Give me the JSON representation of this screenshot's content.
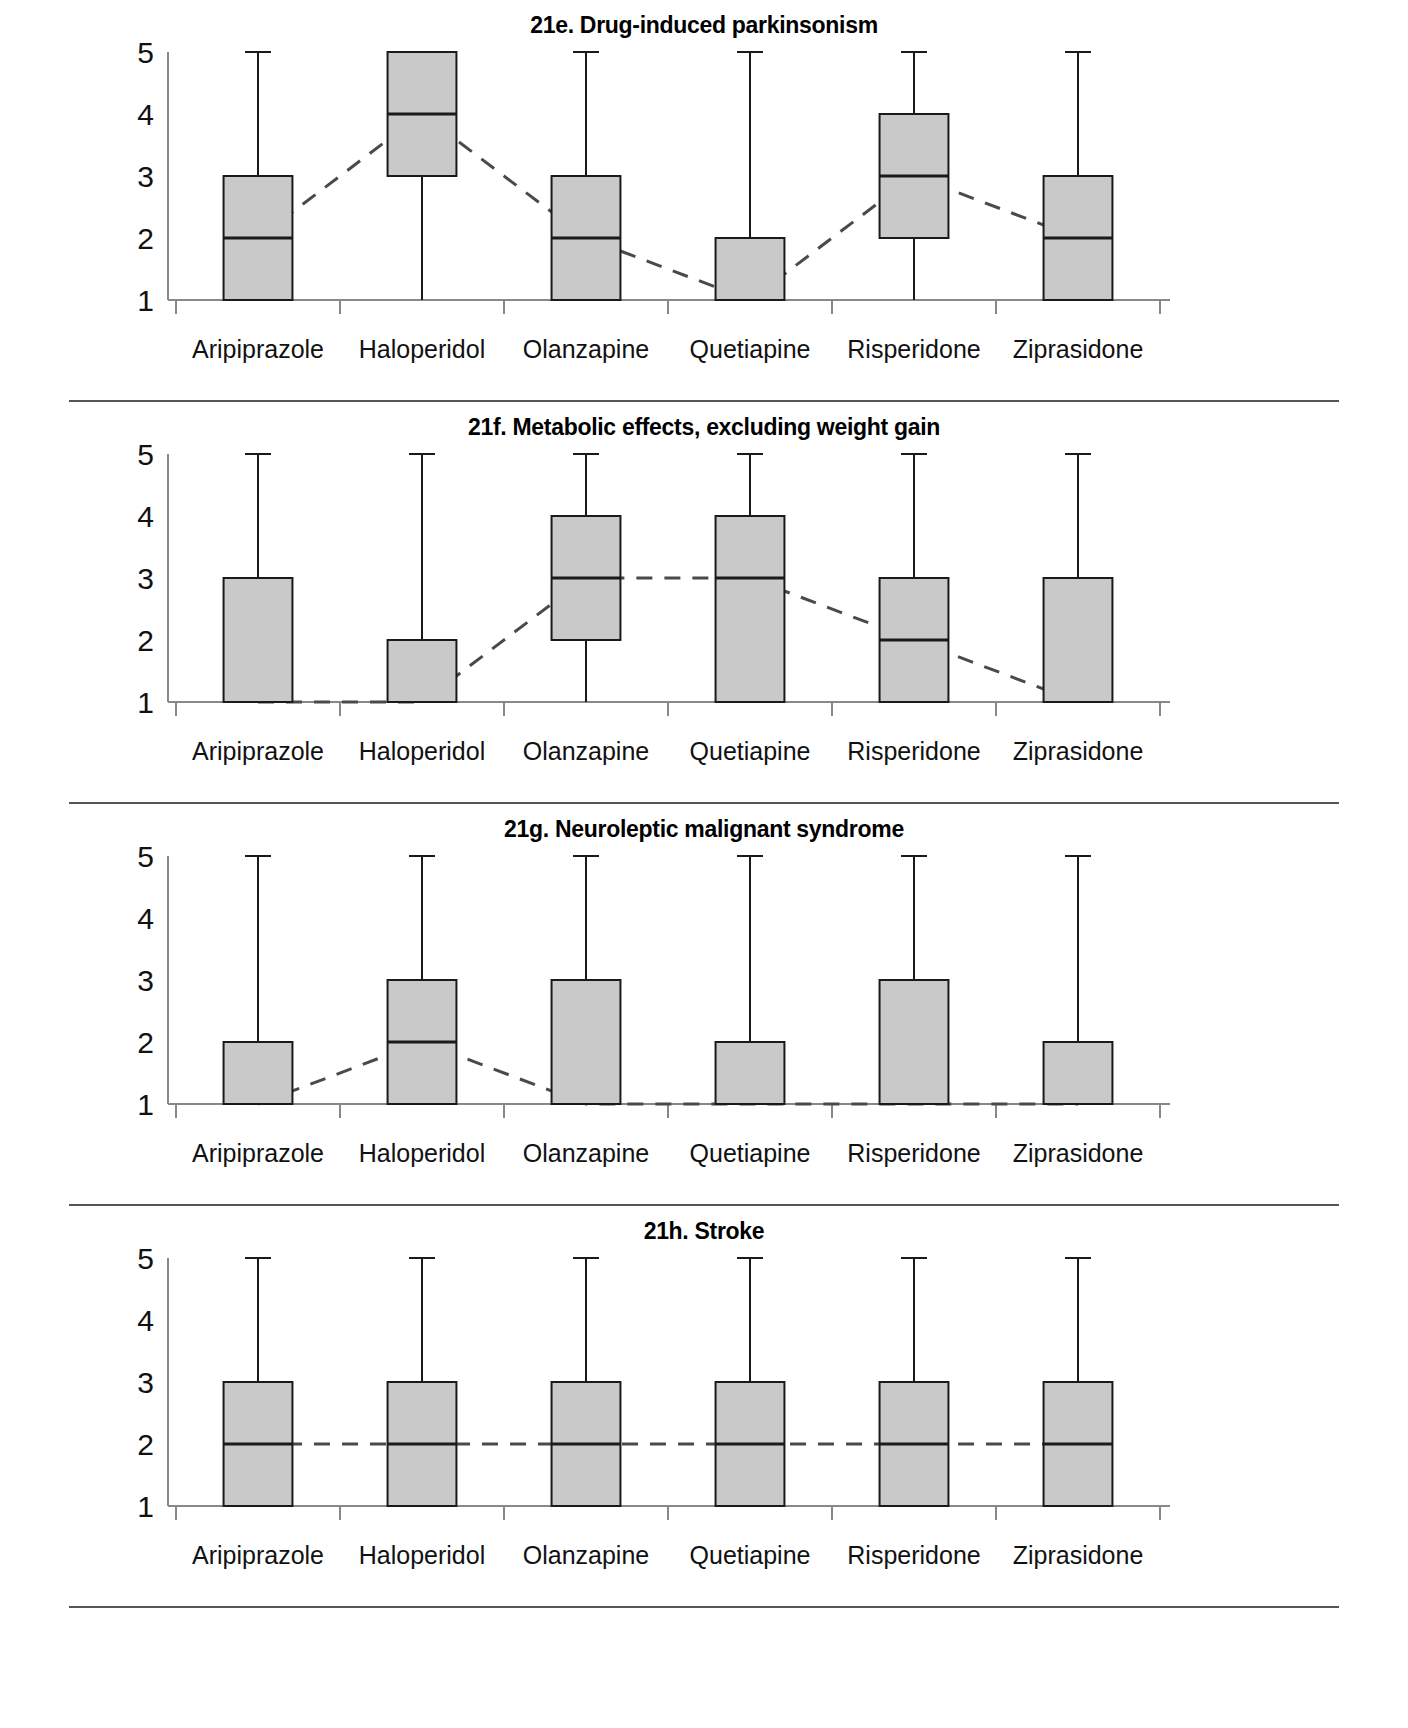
{
  "figure": {
    "scale_min": 1,
    "scale_max": 5,
    "categories": [
      "Aripiprazole",
      "Haloperidol",
      "Olanzapine",
      "Quetiapine",
      "Risperidone",
      "Ziprasidone"
    ],
    "y_ticks": [
      "5",
      "4",
      "3",
      "2",
      "1"
    ],
    "box_fill": "#c9c9c9",
    "box_stroke": "#1a1a1a",
    "connector_color": "#4a4a4a"
  },
  "panels": [
    {
      "id": "21e",
      "title": "21e. Drug-induced parkinsonism"
    },
    {
      "id": "21f",
      "title": "21f. Metabolic effects, excluding weight gain"
    },
    {
      "id": "21g",
      "title": "21g. Neuroleptic malignant syndrome"
    },
    {
      "id": "21h",
      "title": "21h. Stroke"
    }
  ],
  "chart_data": [
    {
      "type": "box",
      "id": "21e",
      "title": "21e. Drug-induced parkinsonism",
      "xlabel": "",
      "ylabel": "",
      "ylim": [
        1,
        5
      ],
      "yticks": [
        1,
        2,
        3,
        4,
        5
      ],
      "grid": false,
      "legend": "none",
      "categories": [
        "Aripiprazole",
        "Haloperidol",
        "Olanzapine",
        "Quetiapine",
        "Risperidone",
        "Ziprasidone"
      ],
      "boxes": [
        {
          "category": "Aripiprazole",
          "q1": 1,
          "median": 2,
          "q3": 3,
          "whisker_low": 1,
          "whisker_high": 5
        },
        {
          "category": "Haloperidol",
          "q1": 3,
          "median": 4,
          "q3": 5,
          "whisker_low": 1,
          "whisker_high": 5
        },
        {
          "category": "Olanzapine",
          "q1": 1,
          "median": 2,
          "q3": 3,
          "whisker_low": 1,
          "whisker_high": 5
        },
        {
          "category": "Quetiapine",
          "q1": 1,
          "median": 1,
          "q3": 2,
          "whisker_low": 1,
          "whisker_high": 5
        },
        {
          "category": "Risperidone",
          "q1": 2,
          "median": 3,
          "q3": 4,
          "whisker_low": 1,
          "whisker_high": 5
        },
        {
          "category": "Ziprasidone",
          "q1": 1,
          "median": 2,
          "q3": 3,
          "whisker_low": 1,
          "whisker_high": 5
        }
      ],
      "median_connector": [
        2,
        4,
        2,
        1,
        3,
        2
      ]
    },
    {
      "type": "box",
      "id": "21f",
      "title": "21f. Metabolic effects, excluding weight gain",
      "xlabel": "",
      "ylabel": "",
      "ylim": [
        1,
        5
      ],
      "yticks": [
        1,
        2,
        3,
        4,
        5
      ],
      "grid": false,
      "legend": "none",
      "categories": [
        "Aripiprazole",
        "Haloperidol",
        "Olanzapine",
        "Quetiapine",
        "Risperidone",
        "Ziprasidone"
      ],
      "boxes": [
        {
          "category": "Aripiprazole",
          "q1": 1,
          "median": 1,
          "q3": 3,
          "whisker_low": 1,
          "whisker_high": 5
        },
        {
          "category": "Haloperidol",
          "q1": 1,
          "median": 1,
          "q3": 2,
          "whisker_low": 1,
          "whisker_high": 5
        },
        {
          "category": "Olanzapine",
          "q1": 2,
          "median": 3,
          "q3": 4,
          "whisker_low": 1,
          "whisker_high": 5
        },
        {
          "category": "Quetiapine",
          "q1": 1,
          "median": 3,
          "q3": 4,
          "whisker_low": 1,
          "whisker_high": 5
        },
        {
          "category": "Risperidone",
          "q1": 1,
          "median": 2,
          "q3": 3,
          "whisker_low": 1,
          "whisker_high": 5
        },
        {
          "category": "Ziprasidone",
          "q1": 1,
          "median": 1,
          "q3": 3,
          "whisker_low": 1,
          "whisker_high": 5
        }
      ],
      "median_connector": [
        1,
        1,
        3,
        3,
        2,
        1
      ]
    },
    {
      "type": "box",
      "id": "21g",
      "title": "21g. Neuroleptic malignant syndrome",
      "xlabel": "",
      "ylabel": "",
      "ylim": [
        1,
        5
      ],
      "yticks": [
        1,
        2,
        3,
        4,
        5
      ],
      "grid": false,
      "legend": "none",
      "categories": [
        "Aripiprazole",
        "Haloperidol",
        "Olanzapine",
        "Quetiapine",
        "Risperidone",
        "Ziprasidone"
      ],
      "boxes": [
        {
          "category": "Aripiprazole",
          "q1": 1,
          "median": 1,
          "q3": 2,
          "whisker_low": 1,
          "whisker_high": 5
        },
        {
          "category": "Haloperidol",
          "q1": 1,
          "median": 2,
          "q3": 3,
          "whisker_low": 1,
          "whisker_high": 5
        },
        {
          "category": "Olanzapine",
          "q1": 1,
          "median": 1,
          "q3": 3,
          "whisker_low": 1,
          "whisker_high": 5
        },
        {
          "category": "Quetiapine",
          "q1": 1,
          "median": 1,
          "q3": 2,
          "whisker_low": 1,
          "whisker_high": 5
        },
        {
          "category": "Risperidone",
          "q1": 1,
          "median": 1,
          "q3": 3,
          "whisker_low": 1,
          "whisker_high": 5
        },
        {
          "category": "Ziprasidone",
          "q1": 1,
          "median": 1,
          "q3": 2,
          "whisker_low": 1,
          "whisker_high": 5
        }
      ],
      "median_connector": [
        1,
        2,
        1,
        1,
        1,
        1
      ]
    },
    {
      "type": "box",
      "id": "21h",
      "title": "21h. Stroke",
      "xlabel": "",
      "ylabel": "",
      "ylim": [
        1,
        5
      ],
      "yticks": [
        1,
        2,
        3,
        4,
        5
      ],
      "grid": false,
      "legend": "none",
      "categories": [
        "Aripiprazole",
        "Haloperidol",
        "Olanzapine",
        "Quetiapine",
        "Risperidone",
        "Ziprasidone"
      ],
      "boxes": [
        {
          "category": "Aripiprazole",
          "q1": 1,
          "median": 2,
          "q3": 3,
          "whisker_low": 1,
          "whisker_high": 5
        },
        {
          "category": "Haloperidol",
          "q1": 1,
          "median": 2,
          "q3": 3,
          "whisker_low": 1,
          "whisker_high": 5
        },
        {
          "category": "Olanzapine",
          "q1": 1,
          "median": 2,
          "q3": 3,
          "whisker_low": 1,
          "whisker_high": 5
        },
        {
          "category": "Quetiapine",
          "q1": 1,
          "median": 2,
          "q3": 3,
          "whisker_low": 1,
          "whisker_high": 5
        },
        {
          "category": "Risperidone",
          "q1": 1,
          "median": 2,
          "q3": 3,
          "whisker_low": 1,
          "whisker_high": 5
        },
        {
          "category": "Ziprasidone",
          "q1": 1,
          "median": 2,
          "q3": 3,
          "whisker_low": 1,
          "whisker_high": 5
        }
      ],
      "median_connector": [
        2,
        2,
        2,
        2,
        2,
        2
      ]
    }
  ]
}
